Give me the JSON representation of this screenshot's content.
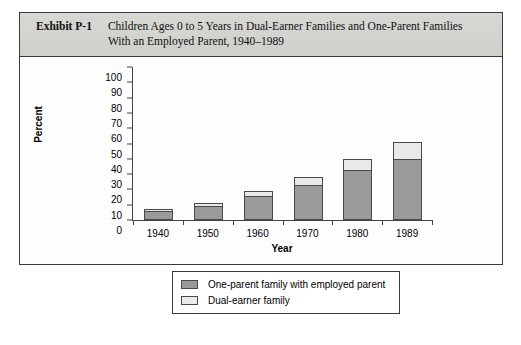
{
  "exhibit": {
    "label": "Exhibit P-1",
    "title": "Children Ages 0 to 5 Years in Dual-Earner Families and One-Parent Families With an Employed Parent, 1940–1989"
  },
  "colors": {
    "one_parent": "#9a9a9a",
    "dual_earner": "#e9e9e9",
    "header_bg": "#d7d7d4",
    "frame": "#3a3a3a"
  },
  "chart_data": {
    "type": "bar",
    "stacked": true,
    "title": "",
    "xlabel": "Year",
    "ylabel": "Percent",
    "categories": [
      "1940",
      "1950",
      "1960",
      "1970",
      "1980",
      "1989"
    ],
    "series": [
      {
        "name": "One-parent family with employed parent",
        "values": [
          6,
          9,
          16,
          23,
          33,
          40
        ]
      },
      {
        "name": "Dual-earner family",
        "values": [
          1.5,
          2,
          3,
          5,
          7,
          11
        ]
      }
    ],
    "totals": [
      7.5,
      11,
      19,
      28,
      40,
      51
    ],
    "ylim": [
      0,
      100
    ],
    "yticks": [
      "0",
      "10",
      "20",
      "30",
      "40",
      "50",
      "60",
      "70",
      "80",
      "90",
      "100"
    ],
    "grid": false,
    "legend_position": "bottom"
  },
  "legend": [
    {
      "label": "One-parent family with employed parent",
      "swatch": "#9a9a9a"
    },
    {
      "label": "Dual-earner family",
      "swatch": "#e9e9e9"
    }
  ]
}
